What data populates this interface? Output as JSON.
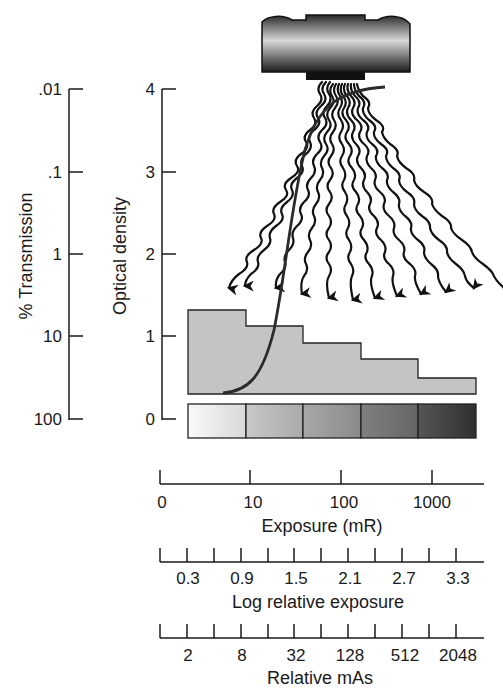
{
  "left_axes": {
    "transmission": {
      "label": "% Transmission",
      "ticks": [
        ".01",
        ".1",
        "1",
        "10",
        "100"
      ]
    },
    "optical_density": {
      "label": "Optical density",
      "ticks": [
        "4",
        "3",
        "2",
        "1",
        "0"
      ]
    }
  },
  "bottom_axes": {
    "exposure": {
      "label": "Exposure (mR)",
      "ticks": [
        "0",
        "10",
        "100",
        "1000"
      ]
    },
    "log_relative": {
      "label": "Log relative exposure",
      "ticks": [
        "0.3",
        "0.9",
        "1.5",
        "2.1",
        "2.7",
        "3.3"
      ]
    },
    "relative_mas": {
      "label": "Relative mAs",
      "ticks": [
        "2",
        "8",
        "32",
        "128",
        "512",
        "2048"
      ]
    }
  },
  "elements": {
    "xray_tube": "x-ray tube",
    "step_wedge": "step wedge (5 steps)",
    "density_strip": "film density strip (5 patches)",
    "curve": "characteristic (H&D) curve"
  },
  "colors": {
    "ink": "#1a1a1a",
    "wedge_fill": "#c4c4c4",
    "patches": [
      "#f2f2f2",
      "#bdbdbd",
      "#9a9a9a",
      "#747474",
      "#454545"
    ]
  }
}
